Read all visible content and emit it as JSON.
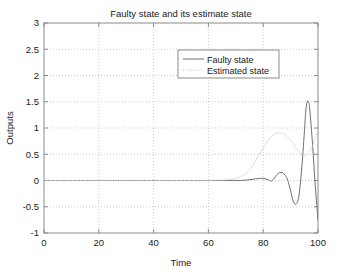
{
  "chart_data": {
    "type": "line",
    "title": "Faulty state and its estimate state",
    "xlabel": "Time",
    "ylabel": "Outputs",
    "xlim": [
      0,
      100
    ],
    "ylim": [
      -1,
      3
    ],
    "xticks": [
      "0",
      "20",
      "40",
      "60",
      "80",
      "100"
    ],
    "xtick_values": [
      0,
      20,
      40,
      60,
      80,
      100
    ],
    "yticks": [
      "-1",
      "-0.5",
      "0",
      "0.5",
      "1",
      "1.5",
      "2",
      "2.5",
      "3"
    ],
    "ytick_values": [
      -1,
      -0.5,
      0,
      0.5,
      1,
      1.5,
      2,
      2.5,
      3
    ],
    "grid": true,
    "grid_style": "dotted",
    "grid_color": "#cccccc",
    "legend_position": "upper-center-right",
    "axis_color": "#808080",
    "series": [
      {
        "name": "Faulty state",
        "style": "solid",
        "color": "#6e6e6e",
        "x": [
          0,
          5,
          10,
          15,
          20,
          25,
          30,
          35,
          40,
          45,
          50,
          55,
          60,
          65,
          70,
          73,
          75,
          77,
          79,
          80,
          81,
          82,
          83,
          84,
          85,
          86,
          87,
          88,
          89,
          90,
          91,
          92,
          93,
          94,
          95,
          95.5,
          96,
          96.5,
          97,
          98,
          99,
          100
        ],
        "values": [
          0,
          0,
          0,
          0,
          0,
          0,
          0,
          0,
          0,
          0,
          0,
          0,
          0,
          0,
          0,
          0.005,
          0.015,
          0.03,
          0.04,
          0.04,
          0.03,
          0.01,
          -0.01,
          0.04,
          0.11,
          0.15,
          0.15,
          0.1,
          0.0,
          -0.2,
          -0.4,
          -0.45,
          -0.3,
          0.2,
          0.9,
          1.3,
          1.49,
          1.5,
          1.35,
          0.7,
          -0.1,
          -0.75
        ]
      },
      {
        "name": "Estimated state",
        "style": "dotted",
        "color": "#d0d0d0",
        "x": [
          0,
          10,
          20,
          30,
          40,
          50,
          60,
          68,
          72,
          75,
          78,
          80,
          82,
          84,
          86,
          88,
          89,
          90,
          91,
          92,
          93,
          94,
          95,
          96,
          97,
          98,
          99,
          100
        ],
        "values": [
          0,
          0,
          0,
          0,
          0,
          0,
          0,
          0.02,
          0.08,
          0.2,
          0.45,
          0.62,
          0.78,
          0.88,
          0.91,
          0.87,
          0.83,
          0.78,
          0.7,
          0.62,
          0.55,
          0.5,
          0.48,
          0.5,
          0.56,
          0.66,
          0.8,
          0.95
        ]
      }
    ]
  },
  "legend": {
    "entries": [
      {
        "label": "Faulty state"
      },
      {
        "label": "Estimated state"
      }
    ]
  }
}
